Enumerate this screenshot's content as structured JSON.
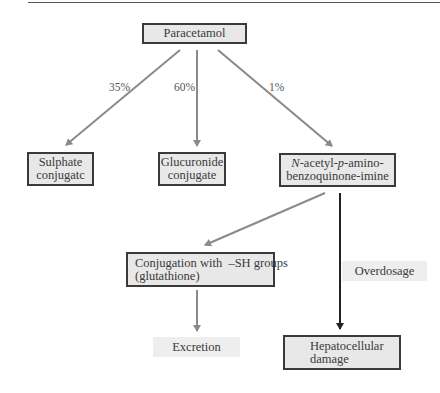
{
  "diagram": {
    "nodes": {
      "paracetamol": {
        "label": "Paracetamol"
      },
      "sulphate": {
        "line1": "Sulphate",
        "line2": "conjugatc"
      },
      "glucuronide": {
        "line1": "Glucuronide",
        "line2": "conjugate"
      },
      "napqi": {
        "line1_italic_n": "N",
        "line1_a": "-acetyl-",
        "line1_italic_p": "p",
        "line1_b": "-amino-",
        "line2": "benzoquinone-imine"
      },
      "conjugation": {
        "line1": "Conjugation with  –SH groups",
        "line2": "(glutathione)"
      },
      "excretion": {
        "label": "Excretion"
      },
      "hepatocellular": {
        "line1": "Hepatocellular",
        "line2": "damage"
      }
    },
    "edges": [
      {
        "from": "paracetamol",
        "to": "sulphate",
        "label": "35%"
      },
      {
        "from": "paracetamol",
        "to": "glucuronide",
        "label": "60%"
      },
      {
        "from": "paracetamol",
        "to": "napqi",
        "label": "1%"
      },
      {
        "from": "napqi",
        "to": "conjugation",
        "label": ""
      },
      {
        "from": "conjugation",
        "to": "excretion",
        "label": ""
      },
      {
        "from": "napqi",
        "to": "hepatocellular",
        "label": "Overdosage"
      }
    ],
    "colors": {
      "box_fill": "#e8e8e8",
      "box_border": "#3a3a3a",
      "arrow_gray": "#8a8a8a",
      "arrow_dark": "#222222",
      "tag_fill": "#eeeeee"
    }
  }
}
